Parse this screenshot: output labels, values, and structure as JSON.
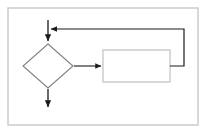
{
  "diagram": {
    "title": "",
    "type": "flowchart",
    "background_color": "#ffffff",
    "frame": {
      "name": "outer-border",
      "x": 8,
      "y": 8,
      "width": 190,
      "height": 117,
      "stroke_color": "#c8c8c8",
      "stroke_width": 1.4,
      "fill": "none"
    },
    "nodes": [
      {
        "id": "decision",
        "shape": "diamond",
        "label": "",
        "cx": 48,
        "cy": 66,
        "half_width": 25,
        "half_height": 22,
        "stroke_color": "#808080",
        "stroke_width": 1.1,
        "fill": "#ffffff"
      },
      {
        "id": "process",
        "shape": "rectangle",
        "label": "",
        "x": 103,
        "y": 50,
        "width": 67,
        "height": 32,
        "stroke_color": "#d0d0d0",
        "stroke_width": 1.6,
        "fill": "#ffffff"
      }
    ],
    "connectors": [
      {
        "id": "entry-arrow",
        "label": "",
        "kind": "arrow-down",
        "points": "48,20 48,41",
        "arrowhead": "end",
        "stroke_color": "#1a1a1a",
        "stroke_width": 1.3
      },
      {
        "id": "decision-to-process",
        "label": "",
        "kind": "arrow-right",
        "points": "74,66 101,66",
        "arrowhead": "end",
        "stroke_color": "#1a1a1a",
        "stroke_width": 1.1
      },
      {
        "id": "feedback-loop",
        "label": "",
        "kind": "arrow-loop",
        "points": "170,66 184,66 184,29 51,29",
        "arrowhead": "end",
        "stroke_color": "#1a1a1a",
        "stroke_width": 1.2
      },
      {
        "id": "exit-arrow",
        "label": "",
        "kind": "arrow-down",
        "points": "48,89 48,107",
        "arrowhead": "end",
        "stroke_color": "#1a1a1a",
        "stroke_width": 1.3
      }
    ]
  }
}
